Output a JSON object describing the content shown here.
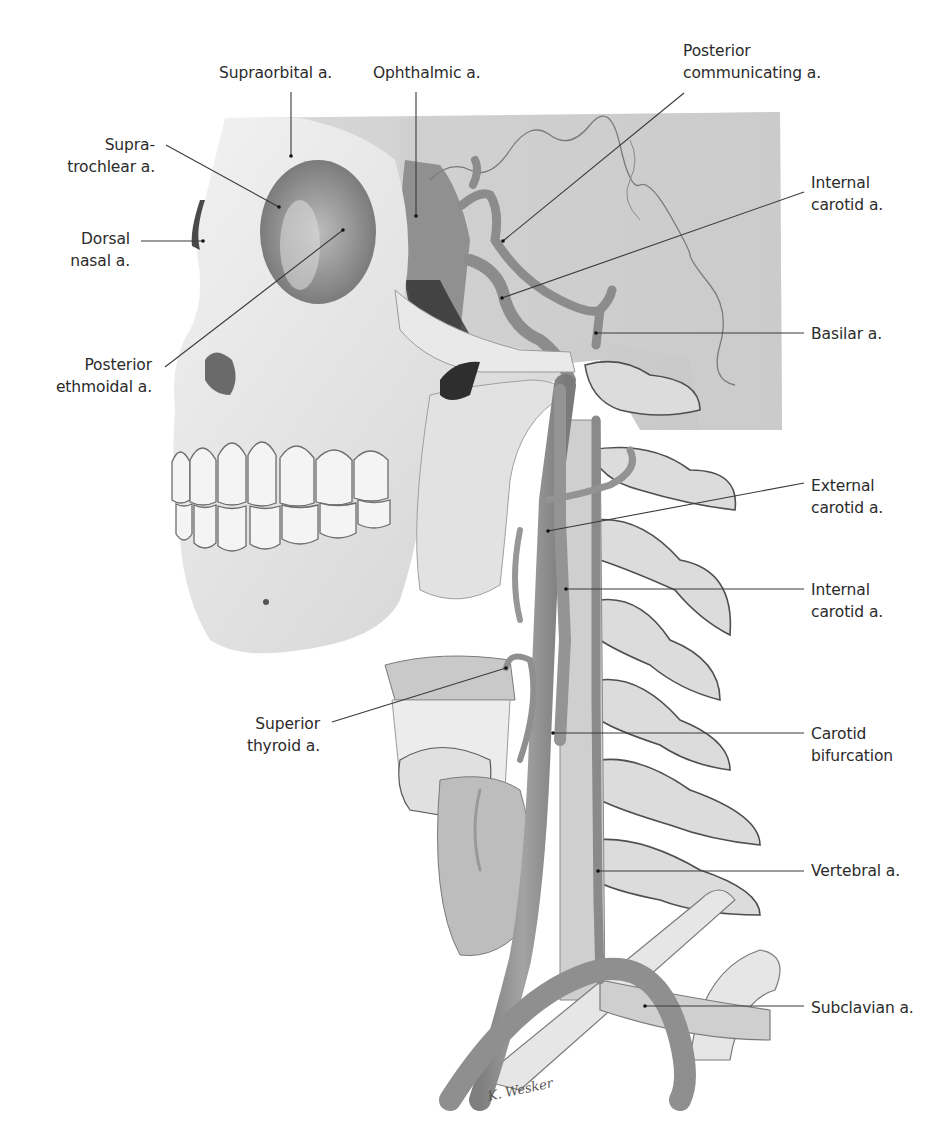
{
  "figure": {
    "colors": {
      "bone": "#e6e6e6",
      "bone_shadow": "#a9a9a9",
      "bone_dark": "#5a5a5a",
      "artery": "#8f8f8f",
      "artery_dark": "#707070",
      "leader_line": "#3a3a3a",
      "label_text": "#2b2b2b",
      "background": "#ffffff"
    },
    "signature": "K. Wesker",
    "labels": [
      {
        "id": "supraorbital",
        "lines": [
          "Supraorbital a."
        ],
        "x": 219,
        "y": 62,
        "align": "left",
        "leader": [
          [
            291,
            92
          ],
          [
            291,
            156
          ]
        ]
      },
      {
        "id": "ophthalmic",
        "lines": [
          "Ophthalmic a."
        ],
        "x": 373,
        "y": 62,
        "align": "left",
        "leader": [
          [
            416,
            92
          ],
          [
            416,
            216
          ]
        ]
      },
      {
        "id": "posterior-communicating",
        "lines": [
          "Posterior",
          "communicating a."
        ],
        "x": 683,
        "y": 40,
        "align": "left",
        "leader": [
          [
            684,
            93
          ],
          [
            503,
            241
          ]
        ]
      },
      {
        "id": "supratrochlear",
        "lines": [
          "Supra-",
          "trochlear a."
        ],
        "x": 60,
        "y": 134,
        "align": "right",
        "rightEdge": 155,
        "leader": [
          [
            166,
            145
          ],
          [
            279,
            207
          ]
        ]
      },
      {
        "id": "internal-carotid-upper",
        "lines": [
          "Internal",
          "carotid a."
        ],
        "x": 811,
        "y": 172,
        "align": "left",
        "leader": [
          [
            804,
            192
          ],
          [
            502,
            298
          ]
        ]
      },
      {
        "id": "dorsal-nasal",
        "lines": [
          "Dorsal",
          "nasal a."
        ],
        "x": 65,
        "y": 228,
        "align": "right",
        "rightEdge": 130,
        "leader": [
          [
            141,
            241
          ],
          [
            203,
            241
          ]
        ]
      },
      {
        "id": "posterior-ethmoidal",
        "lines": [
          "Posterior",
          "ethmoidal a."
        ],
        "x": 50,
        "y": 354,
        "align": "right",
        "rightEdge": 152,
        "leader": [
          [
            165,
            367
          ],
          [
            343,
            230
          ]
        ]
      },
      {
        "id": "basilar",
        "lines": [
          "Basilar a."
        ],
        "x": 811,
        "y": 323,
        "align": "left",
        "leader": [
          [
            804,
            333
          ],
          [
            596,
            333
          ]
        ]
      },
      {
        "id": "external-carotid",
        "lines": [
          "External",
          "carotid a."
        ],
        "x": 811,
        "y": 475,
        "align": "left",
        "leader": [
          [
            804,
            483
          ],
          [
            548,
            531
          ]
        ]
      },
      {
        "id": "internal-carotid-lower",
        "lines": [
          "Internal",
          "carotid a."
        ],
        "x": 811,
        "y": 579,
        "align": "left",
        "leader": [
          [
            804,
            589
          ],
          [
            566,
            589
          ]
        ]
      },
      {
        "id": "superior-thyroid",
        "lines": [
          "Superior",
          "thyroid a."
        ],
        "x": 248,
        "y": 713,
        "align": "right",
        "rightEdge": 320,
        "leader": [
          [
            332,
            722
          ],
          [
            506,
            668
          ]
        ]
      },
      {
        "id": "carotid-bifurcation",
        "lines": [
          "Carotid",
          "bifurcation"
        ],
        "x": 811,
        "y": 723,
        "align": "left",
        "leader": [
          [
            804,
            733
          ],
          [
            553,
            733
          ]
        ]
      },
      {
        "id": "vertebral",
        "lines": [
          "Vertebral a."
        ],
        "x": 811,
        "y": 860,
        "align": "left",
        "leader": [
          [
            804,
            871
          ],
          [
            598,
            871
          ]
        ]
      },
      {
        "id": "subclavian",
        "lines": [
          "Subclavian a."
        ],
        "x": 811,
        "y": 997,
        "align": "left",
        "leader": [
          [
            804,
            1006
          ],
          [
            645,
            1006
          ]
        ]
      }
    ]
  }
}
